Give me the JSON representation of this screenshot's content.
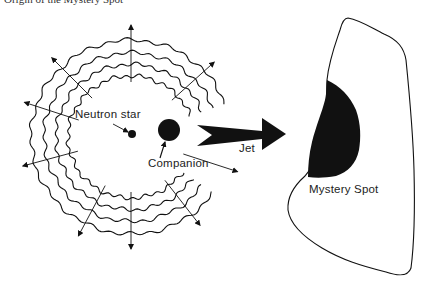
{
  "caption": "Origin of the Mystery Spot",
  "labels": {
    "neutron_star": "Neutron star",
    "companion": "Companion",
    "jet": "Jet",
    "mystery_spot": "Mystery Spot"
  },
  "colors": {
    "ink": "#111111",
    "background": "#ffffff"
  },
  "geometry": {
    "ring_center": [
      131,
      137
    ],
    "ring_radii": [
      63,
      75,
      87,
      100
    ],
    "neutron_star": {
      "cx": 132,
      "cy": 134,
      "r": 4
    },
    "companion": {
      "cx": 169,
      "cy": 130,
      "r": 11
    }
  }
}
